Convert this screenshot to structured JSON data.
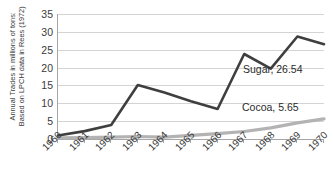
{
  "chart_data": {
    "type": "line",
    "title": "",
    "xlabel": "",
    "ylabel": "Annual Trades in millions of tons: Based on LPCH data in Rees (1972)",
    "ylabel_lines": [
      "Annual Trades in millions of tons:",
      "Based on LPCH data in Rees (1972)"
    ],
    "categories": [
      "1960",
      "1961",
      "1962",
      "1963",
      "1964",
      "1965",
      "1966",
      "1967",
      "1968",
      "1969",
      "1970"
    ],
    "x": [
      1960,
      1961,
      1962,
      1963,
      1964,
      1965,
      1966,
      1967,
      1968,
      1969,
      1970
    ],
    "ylim": [
      0,
      35
    ],
    "ytick_values": [
      0,
      5,
      10,
      15,
      20,
      25,
      30,
      35
    ],
    "ytick_labels": [
      "0",
      "5",
      "10",
      "15",
      "20",
      "25",
      "30",
      "35"
    ],
    "grid": "horizontal",
    "legend": "none",
    "series": [
      {
        "name": "Sugar",
        "color": "#3f3f3f",
        "values": [
          1.0,
          2.2,
          3.9,
          15.1,
          13.0,
          10.6,
          8.4,
          23.8,
          19.7,
          28.7,
          26.54
        ],
        "end_label": "Sugar, 26.54",
        "end_value": 26.54
      },
      {
        "name": "Cocoa",
        "color": "#b3b3b3",
        "values": [
          0.3,
          0.4,
          0.5,
          0.7,
          0.5,
          1.0,
          1.5,
          2.1,
          3.1,
          4.5,
          5.65
        ],
        "end_label": "Cocoa, 5.65",
        "end_value": 5.65
      }
    ],
    "annotations": [
      {
        "text": "Sugar, 26.54",
        "series": "Sugar"
      },
      {
        "text": "Cocoa, 5.65",
        "series": "Cocoa"
      }
    ],
    "colors": {
      "sugar_line": "#3f3f3f",
      "cocoa_line": "#b3b3b3",
      "gridline": "#d4d4d4",
      "axis": "#a6a6a6",
      "text": "#3a3a3a",
      "background": "#ffffff"
    }
  }
}
